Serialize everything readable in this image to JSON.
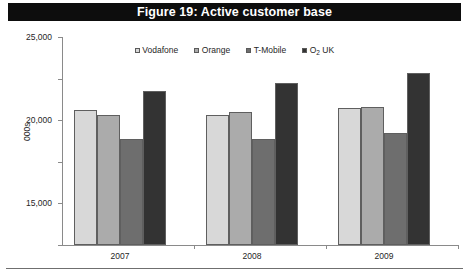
{
  "figure": {
    "title": "Figure 19: Active customer base",
    "title_bar_color": "#0d0d0d",
    "title_text_color": "#ffffff"
  },
  "chart_data": {
    "type": "bar",
    "title": "Figure 19: Active customer base",
    "xlabel": "",
    "ylabel": "000s",
    "categories": [
      "2007",
      "2008",
      "2009"
    ],
    "series": [
      {
        "name": "Vodafone",
        "color": "#d8d8d8",
        "values": [
          16200,
          15600,
          16500
        ]
      },
      {
        "name": "Orange",
        "color": "#ababab",
        "values": [
          15600,
          16000,
          16600
        ]
      },
      {
        "name": "T-Mobile",
        "color": "#6e6e6e",
        "values": [
          12700,
          12700,
          13500
        ]
      },
      {
        "name": "O2 UK",
        "color": "#333333",
        "values": [
          18500,
          19500,
          20700
        ]
      }
    ],
    "ylim": [
      0,
      25000
    ],
    "ytick_values": [
      0,
      5000,
      10000,
      15000,
      20000,
      25000
    ],
    "ytick_labels": [
      "0",
      "5,000",
      "10,000",
      "15,000",
      "20,000",
      "25,000"
    ],
    "grid": false,
    "legend_position": "top-center"
  },
  "legend": {
    "items": [
      {
        "label": "Vodafone",
        "label_prefix": "Vodafone",
        "label_sub": "",
        "label_suffix": "",
        "color": "#d8d8d8"
      },
      {
        "label": "Orange",
        "label_prefix": "Orange",
        "label_sub": "",
        "label_suffix": "",
        "color": "#ababab"
      },
      {
        "label": "T-Mobile",
        "label_prefix": "T-Mobile",
        "label_sub": "",
        "label_suffix": "",
        "color": "#6e6e6e"
      },
      {
        "label": "O2 UK",
        "label_prefix": "O",
        "label_sub": "2",
        "label_suffix": " UK",
        "color": "#333333"
      }
    ]
  },
  "axis": {
    "y_title": "000s"
  }
}
